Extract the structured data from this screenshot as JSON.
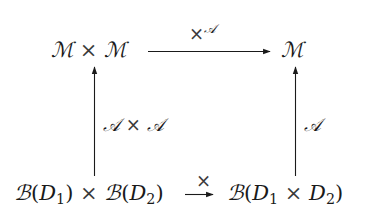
{
  "diagram": {
    "type": "commutative-square",
    "nodes": {
      "top_left": {
        "parts": [
          "ℳ",
          "×",
          "ℳ"
        ],
        "tex": "\\mathcal{M} \\times \\mathcal{M}"
      },
      "top_right": {
        "parts": [
          "ℳ"
        ],
        "tex": "\\mathcal{M}"
      },
      "bottom_left": {
        "tex": "\\mathcal{B}(D_1) \\times \\mathcal{B}(D_2)",
        "b1": "ℬ",
        "open1": "(",
        "d1": "D",
        "d1_sub": "1",
        "close1": ")",
        "times": "×",
        "b2": "ℬ",
        "open2": "(",
        "d2": "D",
        "d2_sub": "2",
        "close2": ")"
      },
      "bottom_right": {
        "tex": "\\mathcal{B}(D_1 \\times D_2)",
        "b": "ℬ",
        "open": "(",
        "d1": "D",
        "d1_sub": "1",
        "times": "×",
        "d2": "D",
        "d2_sub": "2",
        "close": ")"
      }
    },
    "arrows": {
      "top": {
        "from": "top_left",
        "to": "top_right",
        "label_base": "×",
        "label_sup": "𝒜",
        "tex": "\\times^{\\mathcal{A}}"
      },
      "left": {
        "from": "bottom_left",
        "to": "top_left",
        "label_a": "𝒜",
        "label_times": "×",
        "label_b": "𝒜",
        "tex": "\\mathcal{A} \\times \\mathcal{A}"
      },
      "right": {
        "from": "bottom_right",
        "to": "top_right",
        "label": "𝒜",
        "tex": "\\mathcal{A}"
      },
      "bottom": {
        "from": "bottom_left",
        "to": "bottom_right",
        "label": "×",
        "tex": "\\times"
      }
    },
    "colors": {
      "ink": "#1a1a1a",
      "background": "#ffffff"
    }
  }
}
